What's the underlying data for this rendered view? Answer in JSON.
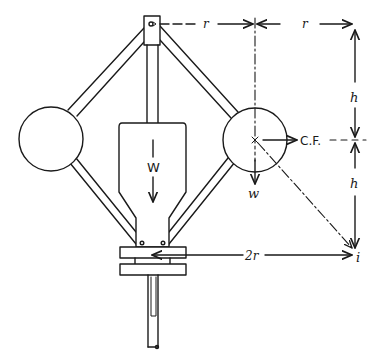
{
  "diagram": {
    "type": "governor-mechanism",
    "labels": {
      "r_top_left": "r",
      "r_top_right": "r",
      "h_upper": "h",
      "h_lower": "h",
      "centrifugal_force": "C.F.",
      "ball_weight": "w",
      "central_weight": "W",
      "two_r": "2r",
      "instantaneous_center": "i"
    },
    "colors": {
      "ink": "#1a1a1a",
      "background": "#ffffff"
    }
  }
}
